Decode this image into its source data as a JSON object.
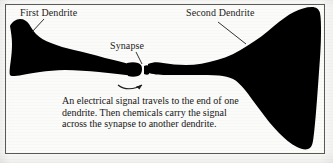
{
  "figure": {
    "type": "labeled-diagram",
    "frame": {
      "border_color": "#5d5a55",
      "background_color": "#fbfbf9"
    },
    "ink_color": "#000000",
    "labels": {
      "first_dendrite": "First Dendrite",
      "second_dendrite": "Second Dendrite",
      "synapse": "Synapse"
    },
    "caption": "An electrical signal travels to the end of one dendrite. Then chemicals carry the signal across the synapse to another dendrite.",
    "annotations": {
      "first_dendrite_leader": "leader-line",
      "second_dendrite_leader": "leader-line",
      "synapse_leader": "leader-line",
      "signal_arrow": "curved-arrow"
    }
  }
}
